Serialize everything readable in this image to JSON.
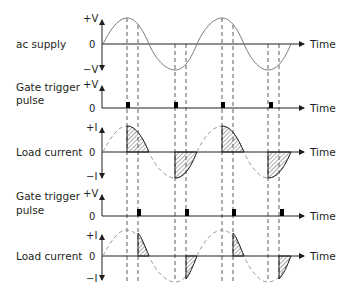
{
  "diagram": {
    "title": "",
    "colors": {
      "line": "#231f20",
      "wave": "#7a7a7a",
      "hatch": "#5a5a5a",
      "dashed": "#4a4a4a"
    },
    "time_label": "Time",
    "panels": [
      {
        "id": "ac-supply",
        "label_lines": [
          "ac supply"
        ],
        "top": "+V",
        "zero": "0",
        "bottom": "−V"
      },
      {
        "id": "gate-trigger-1",
        "label_lines": [
          "Gate trigger",
          "pulse"
        ],
        "top": "+V",
        "zero": "0"
      },
      {
        "id": "load-current-1",
        "label_lines": [
          "Load current"
        ],
        "top": "+I",
        "zero": "0",
        "bottom": "−I"
      },
      {
        "id": "gate-trigger-2",
        "label_lines": [
          "Gate trigger",
          "pulse"
        ],
        "top": "+V",
        "zero": "0"
      },
      {
        "id": "load-current-2",
        "label_lines": [
          "Load current"
        ],
        "top": "+I",
        "zero": "0",
        "bottom": "−I"
      }
    ],
    "notes": {
      "firing_1": "Gate pulses at 90° each half cycle (at peaks); load current conducts from peak to zero crossing",
      "firing_2": "Gate pulses at ~135° each half cycle; load current conducts for a shorter interval"
    }
  }
}
